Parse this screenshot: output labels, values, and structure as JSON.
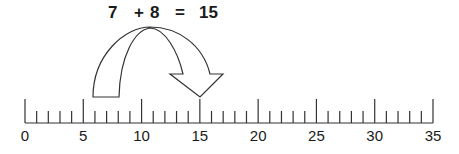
{
  "equation": {
    "addend1": "7",
    "operator": "+",
    "addend2": "8",
    "equals": "=",
    "result": "15"
  },
  "number_line": {
    "min": 0,
    "max": 35,
    "major_step": 5,
    "minor_step": 1,
    "labels": [
      "0",
      "5",
      "10",
      "15",
      "20",
      "25",
      "30",
      "35"
    ]
  },
  "arrow": {
    "from": 7,
    "to": 15,
    "jump": 8
  },
  "colors": {
    "line": "#333333",
    "text": "#1a1a1a",
    "background": "#ffffff"
  }
}
